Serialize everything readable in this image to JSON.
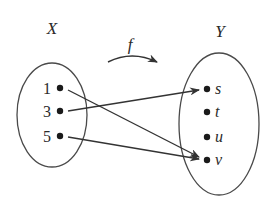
{
  "diagram": {
    "function_label": "f",
    "domain": {
      "label": "X",
      "elements": [
        {
          "label": "1",
          "x": 60,
          "y": 88
        },
        {
          "label": "3",
          "x": 60,
          "y": 111
        },
        {
          "label": "5",
          "x": 60,
          "y": 136
        }
      ]
    },
    "codomain": {
      "label": "Y",
      "elements": [
        {
          "label": "s",
          "x": 207,
          "y": 89
        },
        {
          "label": "t",
          "x": 207,
          "y": 112
        },
        {
          "label": "u",
          "x": 207,
          "y": 137
        },
        {
          "label": "v",
          "x": 207,
          "y": 160
        }
      ]
    },
    "mappings": [
      {
        "from": "1",
        "to": "v"
      },
      {
        "from": "3",
        "to": "s"
      },
      {
        "from": "5",
        "to": "v"
      }
    ],
    "colors": {
      "stroke": "#333333",
      "text": "#2a2a2a",
      "background": "#ffffff"
    }
  }
}
